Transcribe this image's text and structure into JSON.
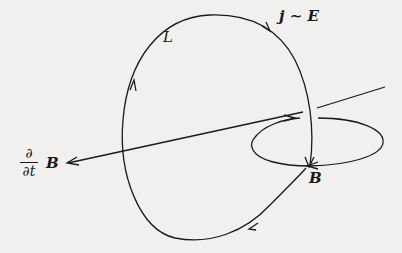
{
  "diagram": {
    "labels": {
      "loop": "L",
      "current": "j ∼ E",
      "dbdt_num": "∂",
      "dbdt_den": "∂t",
      "dbdt_vec": "B",
      "field": "B"
    },
    "colors": {
      "ink": "#1a1a1a",
      "background": "#f1f0ee"
    }
  }
}
